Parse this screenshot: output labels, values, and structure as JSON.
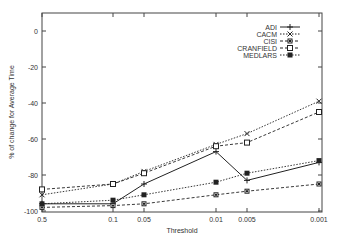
{
  "chart_data": {
    "type": "line",
    "title": "",
    "xlabel": "Threshold",
    "ylabel": "% of change for Average Time",
    "x": [
      "0.5",
      "0.1",
      "0.05",
      "0.01",
      "0.005",
      "0.001"
    ],
    "ylim": [
      -100,
      10
    ],
    "yticks": [
      0,
      -20,
      -40,
      -60,
      -80,
      -100
    ],
    "grid": false,
    "legend_position": "upper right",
    "series": [
      {
        "name": "ADI",
        "marker": "plus",
        "line": "solid",
        "values": [
          -96,
          -96,
          -85,
          -67,
          -83,
          -73
        ]
      },
      {
        "name": "CACM",
        "marker": "x",
        "line": "dotted",
        "values": [
          -91,
          -85,
          -78,
          -63,
          -57,
          -39
        ]
      },
      {
        "name": "CISI",
        "marker": "filled-square-small",
        "line": "dashed",
        "values": [
          -98,
          -97,
          -96,
          -91,
          -89,
          -85
        ]
      },
      {
        "name": "CRANFIELD",
        "marker": "open-square",
        "line": "dashed",
        "values": [
          -88,
          -85,
          -79,
          -64,
          -62,
          -45
        ]
      },
      {
        "name": "MEDLARS",
        "marker": "filled-square",
        "line": "dotted",
        "values": [
          -96,
          -94,
          -91,
          -84,
          -79,
          -72
        ]
      }
    ]
  }
}
